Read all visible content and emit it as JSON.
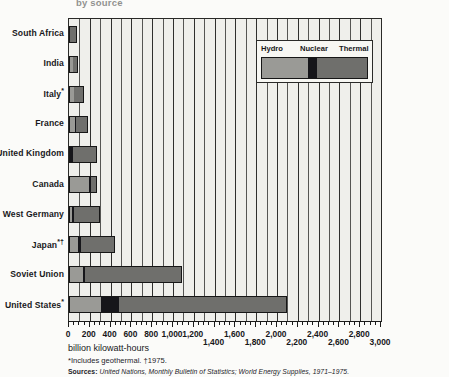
{
  "title": "by source",
  "axis_title": "billion kilowatt-hours",
  "footnote": "*Includes geothermal. †1975.",
  "source_lead": "Sources:",
  "source": "United Nations, Monthly Bulletin of Statistics; World Energy Supplies, 1971–1975.",
  "legend": {
    "hydro": "Hydro",
    "nuclear": "Nuclear",
    "thermal": "Thermal"
  },
  "colors": {
    "hydro": "#9a9a96",
    "nuclear": "#16161a",
    "thermal": "#6f6f6c",
    "plot_background": "#efefeb",
    "gridline": "#2f2f2d",
    "axis": "#1a1a1a"
  },
  "chart_data": {
    "type": "bar",
    "orientation": "horizontal",
    "stacked": true,
    "title": "by source",
    "xlabel": "billion kilowatt-hours",
    "ylabel": "",
    "xlim": [
      0,
      3000
    ],
    "grid": true,
    "legend_position": "inset-top-right",
    "xticks": [
      0,
      200,
      400,
      600,
      800,
      1000,
      1200,
      1400,
      1600,
      1800,
      2000,
      2200,
      2400,
      2600,
      2800,
      3000
    ],
    "xtick_labels": [
      "0",
      "200",
      "400",
      "600",
      "800",
      "1,000",
      "1,200",
      "1,400",
      "1,600",
      "1,800",
      "2,000",
      "2,200",
      "2,400",
      "2,600",
      "2,800",
      "3,000"
    ],
    "categories": [
      "South Africa",
      "India",
      "Italy*",
      "France",
      "United Kingdom",
      "Canada",
      "West Germany",
      "Japan*†",
      "Soviet Union",
      "United States*"
    ],
    "series": [
      {
        "name": "Hydro",
        "values": [
          3,
          33,
          41,
          49,
          5,
          200,
          17,
          84,
          126,
          300
        ]
      },
      {
        "name": "Nuclear",
        "values": [
          0,
          3,
          3,
          18,
          27,
          14,
          21,
          25,
          20,
          172
        ]
      },
      {
        "name": "Thermal",
        "values": [
          72,
          50,
          101,
          111,
          240,
          53,
          263,
          338,
          944,
          1628
        ]
      }
    ],
    "totals": [
      75,
      86,
      145,
      178,
      272,
      267,
      301,
      447,
      1090,
      2100
    ]
  }
}
